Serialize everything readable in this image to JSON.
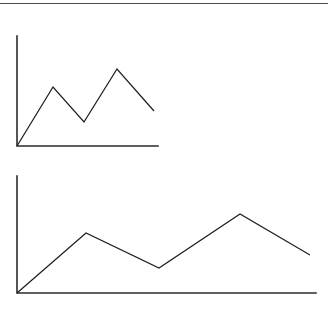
{
  "page": {
    "background_color": "#ffffff",
    "width": 328,
    "height": 311,
    "top_rule_color": "#4a4a4a"
  },
  "axis_style": {
    "color": "#2b2b2b",
    "width": 1.6
  },
  "line_style": {
    "color": "#1f1f1f",
    "width": 1.25
  },
  "chart_data": [
    {
      "type": "line",
      "title": "",
      "subtitle": "",
      "xlabel": "",
      "ylabel": "",
      "grid": false,
      "legend": false,
      "legend_position": "none",
      "xticklabels": [],
      "yticklabels": [],
      "xlim": [
        0,
        6
      ],
      "ylim": [
        0,
        10
      ],
      "axis_origin_px": [
        17,
        146
      ],
      "axis_x_end_px": [
        158,
        146
      ],
      "axis_y_top_px": [
        17,
        36
      ],
      "x": [
        0,
        1,
        2,
        3,
        4
      ],
      "values": [
        0,
        4.3,
        2.2,
        7.0,
        3.2
      ],
      "points_px": [
        [
          17,
          146
        ],
        [
          53,
          87
        ],
        [
          84,
          122
        ],
        [
          117,
          69
        ],
        [
          154,
          111
        ]
      ]
    },
    {
      "type": "line",
      "title": "",
      "subtitle": "",
      "xlabel": "",
      "ylabel": "",
      "grid": false,
      "legend": false,
      "legend_position": "none",
      "xticklabels": [],
      "yticklabels": [],
      "xlim": [
        0,
        6
      ],
      "ylim": [
        0,
        10
      ],
      "axis_origin_px": [
        17,
        293
      ],
      "axis_x_end_px": [
        316,
        293
      ],
      "axis_y_top_px": [
        17,
        176
      ],
      "x": [
        0,
        1,
        2,
        3,
        4
      ],
      "values": [
        0,
        5.1,
        2.1,
        6.7,
        3.2
      ],
      "points_px": [
        [
          17,
          293
        ],
        [
          86,
          233
        ],
        [
          159,
          268
        ],
        [
          240,
          214
        ],
        [
          310,
          255
        ]
      ]
    }
  ]
}
